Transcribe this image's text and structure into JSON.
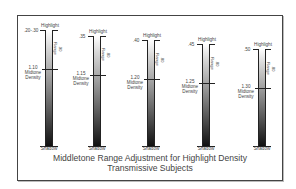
{
  "diagram": {
    "title_line1": "Middletone Range Adjustment for Highlight Density",
    "title_line2": "Transmissive Subjects",
    "columns": [
      {
        "highlight_label": "Highlight",
        "highlight_value": ".20-.30",
        "midtone_value": "1.10",
        "midtone_label_1": "Midtone",
        "midtone_label_2": "Density",
        "range_value": ".90",
        "range_label": "Range",
        "shadow_label": "Shadow"
      },
      {
        "highlight_label": "Highlight",
        "highlight_value": ".35",
        "midtone_value": "1.15",
        "midtone_label_1": "Midtone",
        "midtone_label_2": "Density",
        "range_value": ".80",
        "range_label": "Range",
        "shadow_label": "Shadow"
      },
      {
        "highlight_label": "Highlight",
        "highlight_value": ".40",
        "midtone_value": "1.20",
        "midtone_label_1": "Midtone",
        "midtone_label_2": "Density",
        "range_value": ".80",
        "range_label": "Range",
        "shadow_label": "Shadow"
      },
      {
        "highlight_label": "Highlight",
        "highlight_value": ".45",
        "midtone_value": "1.25",
        "midtone_label_1": "Midtone",
        "midtone_label_2": "Density",
        "range_value": ".80",
        "range_label": "Range",
        "shadow_label": "Shadow"
      },
      {
        "highlight_label": "Highlight",
        "highlight_value": ".50",
        "midtone_value": "1.30",
        "midtone_label_1": "Midtone",
        "midtone_label_2": "Density",
        "range_value": ".80",
        "range_label": "Range",
        "shadow_label": "Shadow"
      }
    ]
  }
}
